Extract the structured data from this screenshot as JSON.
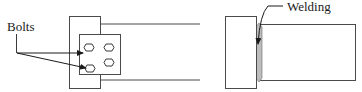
{
  "figures": [
    {
      "name": "bolted-connection",
      "label": "Bolts",
      "bolt_count": 4
    },
    {
      "name": "welded-connection",
      "label": "Welding"
    }
  ],
  "colors": {
    "stroke": "#4a4a4a",
    "text": "#1a1a1a",
    "weld_fill": "#bdbdbd",
    "background": "#ffffff"
  }
}
